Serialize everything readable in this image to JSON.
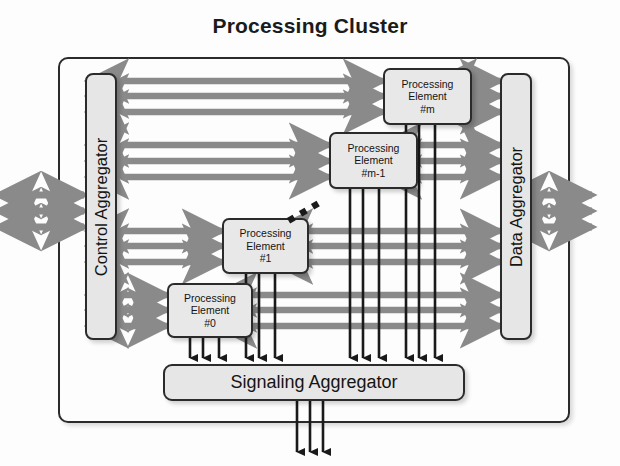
{
  "title": "Processing Cluster",
  "colors": {
    "arrow_grey": "#8a8a8a",
    "arrow_black": "#1a1a1a",
    "box_fill": "#e6e6e6",
    "box_stroke": "#2b2b2b",
    "background": "#fdfdfd"
  },
  "aggregators": {
    "control": {
      "label": "Control Aggregator"
    },
    "data": {
      "label": "Data Aggregator"
    },
    "signaling": {
      "label": "Signaling Aggregator"
    }
  },
  "processing_elements": [
    {
      "line1": "Processing",
      "line2": "Element",
      "line3": "#m"
    },
    {
      "line1": "Processing",
      "line2": "Element",
      "line3": "#m-1"
    },
    {
      "line1": "Processing",
      "line2": "Element",
      "line3": "#1"
    },
    {
      "line1": "Processing",
      "line2": "Element",
      "line3": "#0"
    }
  ],
  "ellipsis": {
    "name": "diagonal-ellipsis",
    "dots": 3
  },
  "bus_counts": {
    "control_to_pe_lanes": 3,
    "pe_to_data_lanes": 3,
    "external_control_lanes": 3,
    "external_data_lanes": 3,
    "signaling_inputs": 12,
    "signaling_outputs": 3
  }
}
